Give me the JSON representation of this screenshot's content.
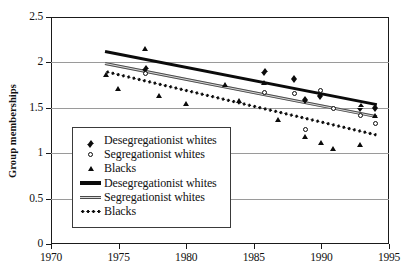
{
  "chart_data": {
    "type": "scatter",
    "title": "",
    "xlabel": "",
    "ylabel": "Group memberships",
    "xlim": [
      1970,
      1995
    ],
    "ylim": [
      0,
      2.5
    ],
    "xticks": [
      1970,
      1975,
      1980,
      1985,
      1990,
      1995
    ],
    "yticks": [
      0,
      0.5,
      1,
      1.5,
      2,
      2.5
    ],
    "xtick_labels": [
      "1970",
      "1975",
      "1980",
      "1985",
      "1990",
      "1995"
    ],
    "ytick_labels": [
      "0",
      "0.5",
      "1",
      "1.5",
      "2",
      "2.5"
    ],
    "grid": "horizontal",
    "legend_position": "lower-left-inside",
    "series": [
      {
        "name": "Desegregationist whites",
        "marker": "filled-diamond",
        "kind": "scatter",
        "points": [
          {
            "x": 1977.0,
            "y": 1.955
          },
          {
            "x": 1985.8,
            "y": 1.925
          },
          {
            "x": 1988.0,
            "y": 1.845
          },
          {
            "x": 1988.8,
            "y": 1.615
          },
          {
            "x": 1989.9,
            "y": 1.665
          },
          {
            "x": 1992.9,
            "y": 1.535
          },
          {
            "x": 1994.0,
            "y": 1.53
          }
        ]
      },
      {
        "name": "Segregationist whites",
        "marker": "open-circle",
        "kind": "scatter",
        "points": [
          {
            "x": 1977.0,
            "y": 1.875
          },
          {
            "x": 1985.8,
            "y": 1.665
          },
          {
            "x": 1988.0,
            "y": 1.66
          },
          {
            "x": 1988.8,
            "y": 1.26
          },
          {
            "x": 1989.9,
            "y": 1.695
          },
          {
            "x": 1990.9,
            "y": 1.495
          },
          {
            "x": 1992.9,
            "y": 1.42
          },
          {
            "x": 1994.0,
            "y": 1.33
          }
        ]
      },
      {
        "name": "Blacks",
        "marker": "filled-triangle",
        "kind": "scatter",
        "points": [
          {
            "x": 1974.1,
            "y": 1.87
          },
          {
            "x": 1975.0,
            "y": 1.705
          },
          {
            "x": 1977.0,
            "y": 2.15
          },
          {
            "x": 1978.0,
            "y": 1.63
          },
          {
            "x": 1980.0,
            "y": 1.545
          },
          {
            "x": 1982.9,
            "y": 1.755
          },
          {
            "x": 1983.9,
            "y": 1.575
          },
          {
            "x": 1985.8,
            "y": 1.775
          },
          {
            "x": 1986.8,
            "y": 1.365
          },
          {
            "x": 1988.8,
            "y": 1.18
          },
          {
            "x": 1990.0,
            "y": 1.115
          },
          {
            "x": 1990.9,
            "y": 1.055
          },
          {
            "x": 1992.9,
            "y": 1.09
          },
          {
            "x": 1994.0,
            "y": 1.415
          }
        ]
      }
    ],
    "trendlines": [
      {
        "name": "Desegregationist  whites",
        "style": "thick-solid-black",
        "x0": 1974.0,
        "y0": 2.12,
        "x1": 1994.1,
        "y1": 1.535
      },
      {
        "name": "Segregationist whites",
        "style": "double-grey",
        "x0": 1974.0,
        "y0": 1.985,
        "x1": 1994.1,
        "y1": 1.4
      },
      {
        "name": "Blacks",
        "style": "dotted-black",
        "x0": 1974.0,
        "y0": 1.9,
        "x1": 1994.1,
        "y1": 1.2
      }
    ]
  },
  "legend": {
    "entries": [
      {
        "label": "Desegregationist whites",
        "key": "filled-diamond-marker"
      },
      {
        "label": "Segregationist whites",
        "key": "open-circle-marker"
      },
      {
        "label": "Blacks",
        "key": "filled-triangle-marker"
      },
      {
        "label": "Desegregationist  whites",
        "key": "thick-black-line"
      },
      {
        "label": "Segregationist whites",
        "key": "double-grey-line"
      },
      {
        "label": "Blacks",
        "key": "dotted-black-line"
      }
    ]
  },
  "colors": {
    "axis": "#1a1a1a",
    "grid": "#9a9a9a",
    "marker": "#0b0b0b",
    "trend_primary": "#0b0b0b",
    "trend_secondary": "#4a4a4a",
    "background": "#ffffff"
  }
}
